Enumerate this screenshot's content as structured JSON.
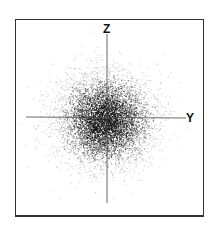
{
  "chart_data": {
    "type": "scatter",
    "title": "",
    "axes": {
      "vertical": {
        "label": "Z"
      },
      "horizontal": {
        "label": "Y"
      },
      "depth": {
        "label": "X"
      }
    },
    "distribution": {
      "kind": "gaussian",
      "center": [
        0,
        0
      ],
      "sigma_px": 22,
      "points": 6000
    },
    "grid": false,
    "legend": null
  },
  "labels": {
    "z": "Z",
    "y": "Y",
    "x": "X"
  },
  "colors": {
    "points": "#111111",
    "axes": "#444444",
    "frame": "#333333",
    "background": "#ffffff"
  }
}
